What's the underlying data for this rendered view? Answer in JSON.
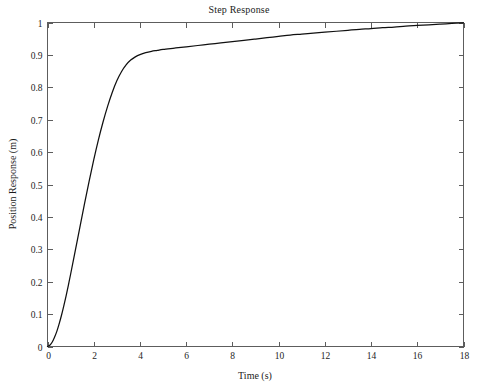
{
  "chart_data": {
    "type": "line",
    "title": "Step Response",
    "xlabel": "Time (s)",
    "ylabel": "Position Response (m)",
    "xlim": [
      0,
      18
    ],
    "ylim": [
      0,
      1
    ],
    "grid": false,
    "legend": null,
    "legend_position": "none",
    "xticks": [
      0,
      2,
      4,
      6,
      8,
      10,
      12,
      14,
      16,
      18
    ],
    "xtick_labels": [
      "0",
      "2",
      "4",
      "6",
      "8",
      "10",
      "12",
      "14",
      "16",
      "18"
    ],
    "yticks": [
      0,
      0.1,
      0.2,
      0.3,
      0.4,
      0.5,
      0.6,
      0.7,
      0.8,
      0.9,
      1
    ],
    "ytick_labels": [
      "0",
      "0.1",
      "0.2",
      "0.3",
      "0.4",
      "0.5",
      "0.6",
      "0.7",
      "0.8",
      "0.9",
      "1"
    ],
    "series": [
      {
        "name": "Position Response",
        "color": "#101010",
        "x": [
          0,
          0.1,
          0.2,
          0.3,
          0.4,
          0.5,
          0.6,
          0.7,
          0.8,
          0.9,
          1.0,
          1.2,
          1.4,
          1.6,
          1.8,
          2.0,
          2.2,
          2.4,
          2.6,
          2.8,
          3.0,
          3.2,
          3.4,
          3.6,
          3.8,
          4.0,
          4.25,
          4.5,
          4.75,
          5.0,
          5.5,
          6.0,
          6.5,
          7.0,
          7.5,
          8.0,
          8.5,
          9.0,
          9.5,
          10.0,
          10.5,
          11.0,
          11.5,
          12.0,
          12.5,
          13.0,
          13.5,
          14.0,
          14.5,
          15.0,
          15.5,
          16.0,
          16.5,
          17.0,
          17.5,
          18.0
        ],
        "y": [
          0.0,
          0.004,
          0.013,
          0.028,
          0.046,
          0.069,
          0.095,
          0.124,
          0.155,
          0.188,
          0.223,
          0.295,
          0.368,
          0.44,
          0.51,
          0.576,
          0.637,
          0.692,
          0.741,
          0.784,
          0.82,
          0.848,
          0.869,
          0.884,
          0.894,
          0.901,
          0.907,
          0.911,
          0.914,
          0.917,
          0.921,
          0.925,
          0.929,
          0.933,
          0.937,
          0.941,
          0.945,
          0.949,
          0.953,
          0.957,
          0.961,
          0.964,
          0.967,
          0.97,
          0.973,
          0.976,
          0.979,
          0.981,
          0.984,
          0.986,
          0.989,
          0.991,
          0.993,
          0.995,
          0.997,
          0.999
        ]
      }
    ]
  },
  "axes": {
    "title": "Step Response",
    "xlabel": "Time (s)",
    "ylabel": "Position Response (m)"
  }
}
